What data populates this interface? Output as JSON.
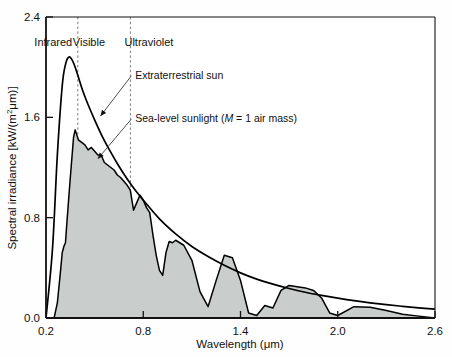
{
  "chart_data": {
    "type": "line",
    "title": "",
    "xlabel": "Wavelength (μm)",
    "ylabel": "Spectral irradiance [kW/(m²μm)]",
    "xlim": [
      0.2,
      2.6
    ],
    "ylim": [
      0.0,
      2.4
    ],
    "xticks": [
      "0.2",
      "0.8",
      "1.4",
      "2.0",
      "2.6"
    ],
    "xtick_values": [
      0.2,
      0.8,
      1.4,
      2.0,
      2.6
    ],
    "yticks": [
      "0.0",
      "0.8",
      "1.6",
      "2.4"
    ],
    "ytick_values": [
      0.0,
      0.8,
      1.6,
      2.4
    ],
    "grid": false,
    "legend_position": "inline-annotations",
    "fill_color": "#c9cdcb",
    "line_color": "#000000",
    "series": [
      {
        "name": "Extraterrestrial sun",
        "style": "smooth-envelope",
        "x": [
          0.2,
          0.24,
          0.27,
          0.3,
          0.32,
          0.34,
          0.36,
          0.38,
          0.4,
          0.43,
          0.46,
          0.5,
          0.55,
          0.6,
          0.65,
          0.7,
          0.75,
          0.8,
          0.9,
          1.0,
          1.1,
          1.2,
          1.3,
          1.4,
          1.5,
          1.6,
          1.7,
          1.8,
          1.9,
          2.0,
          2.1,
          2.2,
          2.3,
          2.4,
          2.5,
          2.6
        ],
        "values": [
          0.0,
          0.55,
          1.3,
          1.85,
          2.02,
          2.08,
          2.06,
          2.0,
          1.92,
          1.8,
          1.7,
          1.58,
          1.44,
          1.32,
          1.21,
          1.11,
          1.02,
          0.94,
          0.79,
          0.67,
          0.57,
          0.49,
          0.42,
          0.36,
          0.31,
          0.27,
          0.235,
          0.205,
          0.18,
          0.158,
          0.138,
          0.121,
          0.106,
          0.093,
          0.081,
          0.07
        ]
      },
      {
        "name": "Sea-level sunlight (M = 1 air mass)",
        "style": "jagged-filled",
        "x": [
          0.2,
          0.25,
          0.27,
          0.29,
          0.3,
          0.31,
          0.32,
          0.33,
          0.34,
          0.35,
          0.36,
          0.37,
          0.38,
          0.39,
          0.4,
          0.42,
          0.44,
          0.46,
          0.48,
          0.5,
          0.52,
          0.54,
          0.56,
          0.58,
          0.6,
          0.62,
          0.64,
          0.66,
          0.68,
          0.7,
          0.72,
          0.74,
          0.76,
          0.78,
          0.8,
          0.82,
          0.84,
          0.86,
          0.88,
          0.9,
          0.92,
          0.94,
          0.96,
          0.98,
          1.0,
          1.05,
          1.1,
          1.15,
          1.2,
          1.25,
          1.3,
          1.35,
          1.4,
          1.45,
          1.5,
          1.55,
          1.6,
          1.65,
          1.7,
          1.75,
          1.8,
          1.85,
          1.9,
          1.95,
          2.0,
          2.1,
          2.2,
          2.3,
          2.4,
          2.5,
          2.6
        ],
        "values": [
          0.0,
          0.0,
          0.12,
          0.38,
          0.52,
          0.57,
          0.6,
          0.78,
          0.95,
          1.12,
          1.28,
          1.44,
          1.5,
          1.46,
          1.42,
          1.4,
          1.38,
          1.34,
          1.36,
          1.33,
          1.3,
          1.3,
          1.24,
          1.22,
          1.2,
          1.18,
          1.14,
          1.12,
          1.09,
          1.06,
          1.02,
          0.86,
          0.92,
          0.98,
          0.94,
          0.88,
          0.84,
          0.66,
          0.5,
          0.38,
          0.34,
          0.52,
          0.61,
          0.6,
          0.62,
          0.58,
          0.46,
          0.21,
          0.09,
          0.3,
          0.5,
          0.48,
          0.3,
          0.04,
          0.02,
          0.1,
          0.08,
          0.22,
          0.26,
          0.25,
          0.24,
          0.22,
          0.16,
          0.04,
          0.02,
          0.09,
          0.085,
          0.06,
          0.03,
          0.015,
          0.0
        ]
      }
    ],
    "bands": [
      {
        "label": "Infrared",
        "from": 0.2,
        "to": 0.39,
        "label_x": 0.245
      },
      {
        "label": "Visible",
        "from": 0.39,
        "to": 0.71,
        "label_x": 0.465
      },
      {
        "label": "Ultraviolet",
        "from": 0.71,
        "to": 2.6,
        "label_x": 0.835
      }
    ],
    "band_dividers": [
      0.39,
      0.71
    ],
    "annotations": [
      {
        "name": "extraterrestrial-sun",
        "text": "Extraterrestrial sun",
        "text_x": 0.75,
        "text_y": 1.905,
        "point_x": 0.536,
        "point_y": 1.61
      },
      {
        "name": "sea-level-sunlight",
        "text_prefix": "Sea-level sunlight (",
        "text_italic": "M",
        "text_suffix": " = 1 air mass)",
        "text": "Sea-level sunlight (M = 1 air mass)",
        "text_x": 0.75,
        "text_y": 1.56,
        "point_x": 0.52,
        "point_y": 1.27
      }
    ]
  }
}
